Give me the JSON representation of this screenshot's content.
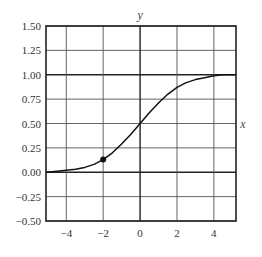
{
  "chart_data": {
    "type": "line",
    "title": "",
    "xlabel": "x",
    "ylabel": "y",
    "xlim": [
      -5.1,
      5.2
    ],
    "ylim": [
      -0.5,
      1.5
    ],
    "grid": true,
    "legend": null,
    "x_ticks": [
      -4,
      -2,
      0,
      2,
      4
    ],
    "x_tick_labels": [
      "−4",
      "−2",
      "0",
      "2",
      "4"
    ],
    "y_ticks": [
      -0.5,
      -0.25,
      0,
      0.25,
      0.5,
      0.75,
      1.0,
      1.25,
      1.5
    ],
    "y_tick_labels": [
      "−0.50",
      "−0.25",
      "0.00",
      "0.25",
      "0.50",
      "0.75",
      "1.00",
      "1.25",
      "1.50"
    ],
    "series": [
      {
        "name": "curve",
        "x": [
          -5.1,
          -4.5,
          -4,
          -3.5,
          -3,
          -2.5,
          -2,
          -1.5,
          -1,
          -0.5,
          0,
          0.5,
          1,
          1.5,
          2,
          2.5,
          3,
          3.5,
          4,
          4.5,
          5.2
        ],
        "y": [
          0.0,
          0.01,
          0.02,
          0.03,
          0.05,
          0.08,
          0.13,
          0.2,
          0.29,
          0.39,
          0.5,
          0.61,
          0.71,
          0.8,
          0.87,
          0.92,
          0.95,
          0.97,
          0.99,
          1.0,
          1.0
        ]
      }
    ],
    "annotations": [
      {
        "type": "point",
        "x": -2,
        "y": 0.13,
        "marker": "filled-circle"
      }
    ],
    "emphasized_lines": {
      "y": [
        0,
        1
      ]
    }
  }
}
